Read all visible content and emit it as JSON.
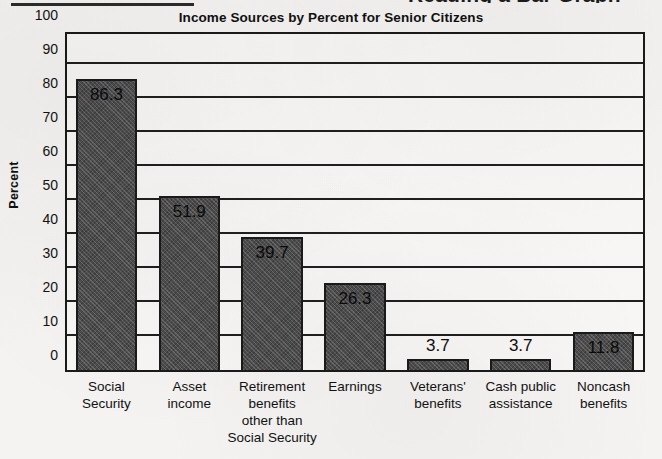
{
  "page": {
    "clipped_heading_remnant": "Reading a Bar Graph",
    "top_rule": "horizontal-rule"
  },
  "chart_data": {
    "type": "bar",
    "title": "Income Sources by Percent for Senior Citizens",
    "xlabel": "",
    "ylabel": "Percent",
    "ylim": [
      0,
      100
    ],
    "ytick_step": 10,
    "grid": true,
    "legend": "none",
    "orientation": "vertical",
    "bar_color": "#4c4c4c",
    "background_color": "#f4f3f1",
    "axis_color": "#1a1a1a",
    "categories": [
      "Social Security",
      "Asset income",
      "Retirement benefits other than Social Security",
      "Earnings",
      "Veterans' benefits",
      "Cash public assistance",
      "Noncash benefits"
    ],
    "category_lines": [
      [
        "Social",
        "Security"
      ],
      [
        "Asset",
        "income"
      ],
      [
        "Retirement",
        "benefits",
        "other than",
        "Social Security"
      ],
      [
        "Earnings"
      ],
      [
        "Veterans'",
        "benefits"
      ],
      [
        "Cash public",
        "assistance"
      ],
      [
        "Noncash",
        "benefits"
      ]
    ],
    "values": [
      86.3,
      51.9,
      39.7,
      26.3,
      3.7,
      3.7,
      11.8
    ],
    "value_labels": [
      "86.3",
      "51.9",
      "39.7",
      "26.3",
      "3.7",
      "3.7",
      "11.8"
    ],
    "value_label_placement": [
      "inside",
      "inside",
      "inside",
      "inside",
      "above",
      "above",
      "inside"
    ],
    "yticks": [
      "100",
      "90",
      "80",
      "70",
      "60",
      "50",
      "40",
      "30",
      "20",
      "10",
      "0"
    ]
  }
}
